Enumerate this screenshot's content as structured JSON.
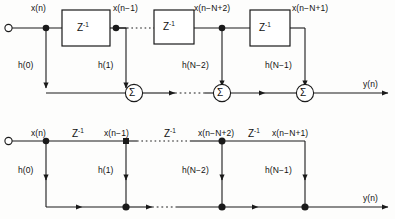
{
  "figure": {
    "type": "block-diagram",
    "stroke_color": "#1a1a1a",
    "background_color": "#fdfdfc",
    "delay_label": "Z",
    "delay_exponent": "-1",
    "sum_symbol": "Σ",
    "ellipsis": "····"
  },
  "diagrams": [
    {
      "id": "top",
      "name": "fir-with-delay-blocks",
      "input_label": "x(n)",
      "output_label": "y(n)",
      "tap_signals": [
        "x(n)",
        "x(n−1)",
        "x(n−N+2)",
        "x(n−N+1)"
      ],
      "coefficients": [
        "h(0)",
        "h(1)",
        "h(N−2)",
        "h(N−1)"
      ],
      "delay_blocks": [
        "Z",
        "Z",
        "Z"
      ],
      "summers": [
        "Σ",
        "Σ",
        "Σ"
      ]
    },
    {
      "id": "bottom",
      "name": "fir-with-inline-delays",
      "input_label": "x(n)",
      "output_label": "y(n)",
      "tap_signals": [
        "x(n)",
        "x(n−1)",
        "x(n−N+2)",
        "x(n−N+1)"
      ],
      "coefficients": [
        "h(0)",
        "h(1)",
        "h(N−2)",
        "h(N−1)"
      ],
      "delay_labels": [
        "Z",
        "Z",
        "Z"
      ]
    }
  ]
}
